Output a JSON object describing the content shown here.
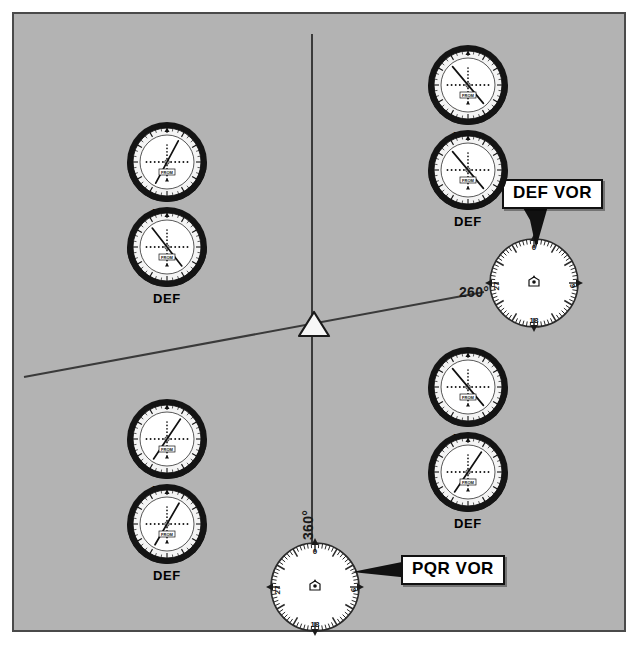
{
  "figure": {
    "background_color": "#b3b3b3",
    "border_color": "#4a4a4a",
    "type": "vor-navigation-diagram"
  },
  "aircraft": {
    "symbol_name": "aircraft-triangle",
    "fill": "#f5f5f5"
  },
  "radials": [
    {
      "id": "radial-360",
      "label": "360°",
      "from_station": "PQR",
      "orientation": "vertical",
      "label_rotation": -90
    },
    {
      "id": "radial-260",
      "label": "260°",
      "from_station": "DEF",
      "orientation": "diagonal",
      "label_rotation": 0
    }
  ],
  "stations": [
    {
      "id": "def-vor",
      "callout": "DEF VOR",
      "rose_labels": [
        "0",
        "9",
        "18",
        "27"
      ],
      "symbol": "vor-station-symbol"
    },
    {
      "id": "pqr-vor",
      "callout": "PQR VOR",
      "rose_labels": [
        "0",
        "9",
        "18",
        "27"
      ],
      "symbol": "vor-station-symbol"
    }
  ],
  "instrument_flag": "FROM",
  "compass_card_ticks": [
    "3",
    "6",
    "9",
    "12",
    "15",
    "18",
    "21",
    "24",
    "27",
    "30",
    "33",
    "0"
  ],
  "instrument_groups": [
    {
      "id": "group-top-left",
      "position": "upper-left",
      "instruments": [
        {
          "id": "tl-pqr",
          "label": "PQR",
          "flag": "FROM",
          "needle_angle": 28,
          "deflection": "right"
        },
        {
          "id": "tl-def",
          "label": "DEF",
          "flag": "FROM",
          "needle_angle": -38,
          "deflection": "left"
        }
      ]
    },
    {
      "id": "group-top-right",
      "position": "upper-right",
      "instruments": [
        {
          "id": "tr-pqr",
          "label": "PQR",
          "flag": "FROM",
          "needle_angle": -40,
          "deflection": "left"
        },
        {
          "id": "tr-def",
          "label": "DEF",
          "flag": "FROM",
          "needle_angle": -40,
          "deflection": "left"
        }
      ]
    },
    {
      "id": "group-bottom-left",
      "position": "lower-left",
      "instruments": [
        {
          "id": "bl-pqr",
          "label": "PQR",
          "flag": "FROM",
          "needle_angle": 34,
          "deflection": "right"
        },
        {
          "id": "bl-def",
          "label": "DEF",
          "flag": "FROM",
          "needle_angle": 30,
          "deflection": "right"
        }
      ]
    },
    {
      "id": "group-bottom-right",
      "position": "lower-right",
      "instruments": [
        {
          "id": "br-pqr",
          "label": "PQR",
          "flag": "FROM",
          "needle_angle": -40,
          "deflection": "left"
        },
        {
          "id": "br-def",
          "label": "DEF",
          "flag": "FROM",
          "needle_angle": 34,
          "deflection": "right"
        }
      ]
    }
  ]
}
